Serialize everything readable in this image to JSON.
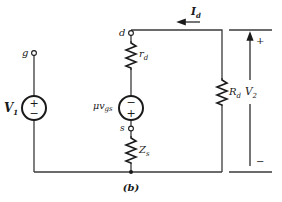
{
  "figure": {
    "caption": "(b)"
  },
  "nodes": {
    "gate": {
      "label": "g"
    },
    "drain": {
      "label": "d"
    },
    "source": {
      "label": "s"
    }
  },
  "components": {
    "input_source": {
      "label_main": "V",
      "label_sub": "1",
      "polarity_top": "+",
      "polarity_bottom": "−"
    },
    "dependent_source": {
      "label_main": "μv",
      "label_sub": "gs",
      "polarity_top": "−",
      "polarity_bottom": "+"
    },
    "drain_resistance": {
      "label_main": "r",
      "label_sub": "d"
    },
    "source_impedance": {
      "label_main": "Z",
      "label_sub": "s"
    },
    "load_resistor": {
      "label_main": "R",
      "label_sub": "d"
    }
  },
  "annotations": {
    "current": {
      "label_main": "I",
      "label_sub": "d",
      "direction": "left"
    },
    "output_voltage": {
      "label_main": "V",
      "label_sub": "2",
      "plus": "+",
      "minus": "−"
    }
  },
  "colors": {
    "line": "#3a3a3a",
    "ink": "#1a1a1a",
    "background": "#ffffff"
  }
}
